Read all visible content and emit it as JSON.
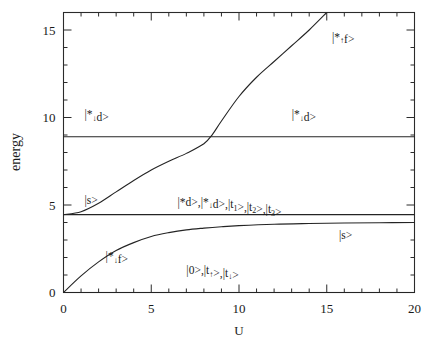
{
  "chart_data": {
    "type": "line",
    "title": "",
    "xlabel": "U",
    "ylabel": "energy",
    "xlim": [
      0,
      20
    ],
    "ylim": [
      0,
      16
    ],
    "xticks": [
      0,
      5,
      10,
      15,
      20
    ],
    "xticklabels": [
      "0",
      "5",
      "10",
      "15",
      "20"
    ],
    "yticks": [
      0,
      5,
      10,
      15
    ],
    "yticklabels": [
      "0",
      "5",
      "10",
      "15"
    ],
    "minor_tick_step_x": 1,
    "minor_tick_step_y": 1,
    "grid": false,
    "legend": "inline-annotations",
    "series": [
      {
        "name": "|0>,|t_up>,|t_dn>",
        "kind": "flat-level",
        "x": [
          0,
          20
        ],
        "y": [
          0,
          0
        ]
      },
      {
        "name": "|*d>,|*_dn d>,|t_1>,|t_2>,|t_3>",
        "kind": "flat-level",
        "x": [
          0,
          20
        ],
        "y": [
          4.45,
          4.45
        ]
      },
      {
        "name": "|*_dn d>",
        "kind": "flat-level",
        "x": [
          0,
          20
        ],
        "y": [
          8.9,
          8.9
        ]
      },
      {
        "name": "|s>",
        "kind": "saturating-rise",
        "x": [
          0,
          1,
          2,
          3,
          4,
          5,
          6,
          7,
          8,
          9,
          10,
          12,
          14,
          16,
          18,
          20
        ],
        "y": [
          0.0,
          0.95,
          1.75,
          2.4,
          2.85,
          3.2,
          3.42,
          3.58,
          3.68,
          3.76,
          3.82,
          3.9,
          3.94,
          3.97,
          3.99,
          4.0
        ]
      },
      {
        "name": "|*_up f>",
        "kind": "sigmoid-rise",
        "x": [
          0,
          1,
          2,
          3,
          4,
          5,
          6,
          7,
          8,
          8.5,
          9,
          10,
          11,
          12,
          13,
          14,
          15
        ],
        "y": [
          4.45,
          4.62,
          5.1,
          5.75,
          6.4,
          7.0,
          7.5,
          7.95,
          8.5,
          9.05,
          9.8,
          11.2,
          12.3,
          13.2,
          14.1,
          15.0,
          16.0
        ]
      }
    ],
    "annotations": [
      {
        "id": "ann-star-dn-d-left",
        "text_parts": [
          "|*",
          "↓",
          "d>"
        ],
        "x": 1.2,
        "y": 9.95
      },
      {
        "id": "ann-star-dn-d-right",
        "text_parts": [
          "|*",
          "↓",
          "d>"
        ],
        "x": 13.0,
        "y": 9.95
      },
      {
        "id": "ann-star-up-f-top",
        "text_parts": [
          "|*",
          "↑",
          "f>"
        ],
        "x": 15.3,
        "y": 14.4
      },
      {
        "id": "ann-s-left",
        "text_parts": [
          "|s>"
        ],
        "x": 1.2,
        "y": 5.05
      },
      {
        "id": "ann-s-right",
        "text_parts": [
          "|s>"
        ],
        "x": 15.7,
        "y": 3.05
      },
      {
        "id": "ann-degenerate",
        "text_parts": [
          "|*d>,|*",
          "↓",
          "d>,|t",
          "1",
          ">,|t",
          "2",
          ">,|t",
          "3",
          ">"
        ],
        "x": 6.5,
        "y": 4.95
      },
      {
        "id": "ann-ground",
        "text_parts": [
          "|0>,|t",
          "↑",
          ">,|t",
          "↓",
          ">"
        ],
        "x": 7.0,
        "y": 1.05
      },
      {
        "id": "ann-star-up-f-low",
        "text_parts": [
          "|*",
          "↓",
          "f>"
        ],
        "x": 2.4,
        "y": 1.85
      }
    ]
  },
  "labels": {
    "y_axis_title": "energy",
    "x_axis_title": "U",
    "x_tick_0": "0",
    "x_tick_1": "5",
    "x_tick_2": "10",
    "x_tick_3": "15",
    "x_tick_4": "20",
    "y_tick_0": "0",
    "y_tick_1": "5",
    "y_tick_2": "10",
    "y_tick_3": "15"
  },
  "annotation_text": {
    "star_dn_d_left": "|*↓d>",
    "star_dn_d_right": "|*↓d>",
    "star_up_f_top": "|*↑f>",
    "s_left": "|s>",
    "s_right": "|s>",
    "degenerate": "|*d>,|*↓d>,|t₁>,|t₂>,|t₃>",
    "ground": "|0>,|t↑>,|t↓>",
    "star_up_f_low": "|*↓f>"
  },
  "colors": {
    "background": "#ffffff",
    "ink": "#242424",
    "axis": "#2b2b2b"
  }
}
